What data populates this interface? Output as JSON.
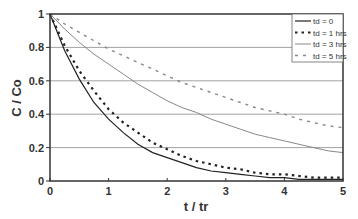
{
  "chart_data": {
    "type": "line",
    "title": "",
    "xlabel": "t / tr",
    "ylabel": "C / Co",
    "xlim": [
      0,
      5
    ],
    "ylim": [
      0,
      1
    ],
    "x_ticks": [
      "0",
      "1",
      "2",
      "3",
      "4",
      "5"
    ],
    "y_ticks": [
      "0",
      "0.2",
      "0.4",
      "0.6",
      "0.8",
      "1"
    ],
    "grid": "horizontal",
    "legend_position": "top-right (inside)",
    "x": [
      0,
      0.25,
      0.5,
      0.75,
      1,
      1.25,
      1.5,
      1.75,
      2,
      2.25,
      2.5,
      2.75,
      3,
      3.25,
      3.5,
      3.75,
      4,
      4.25,
      4.5,
      4.75,
      5
    ],
    "series": [
      {
        "name": "td = 0",
        "style": "solid-black",
        "values": [
          1.0,
          0.78,
          0.61,
          0.47,
          0.37,
          0.29,
          0.22,
          0.17,
          0.14,
          0.11,
          0.08,
          0.06,
          0.05,
          0.04,
          0.03,
          0.02,
          0.02,
          0.01,
          0.01,
          0.01,
          0.01
        ]
      },
      {
        "name": "td = 1 hrs",
        "style": "bold-dotted-black",
        "values": [
          1.0,
          0.81,
          0.66,
          0.54,
          0.43,
          0.35,
          0.29,
          0.23,
          0.19,
          0.15,
          0.12,
          0.1,
          0.08,
          0.07,
          0.05,
          0.04,
          0.04,
          0.03,
          0.02,
          0.02,
          0.02
        ]
      },
      {
        "name": "td = 3 hrs",
        "style": "solid-gray",
        "values": [
          1.0,
          0.91,
          0.83,
          0.76,
          0.7,
          0.64,
          0.58,
          0.53,
          0.48,
          0.44,
          0.41,
          0.37,
          0.34,
          0.31,
          0.28,
          0.26,
          0.24,
          0.22,
          0.2,
          0.18,
          0.17
        ]
      },
      {
        "name": "td = 5 hrs",
        "style": "dashed-gray",
        "values": [
          1.0,
          0.94,
          0.89,
          0.84,
          0.79,
          0.75,
          0.71,
          0.67,
          0.63,
          0.59,
          0.56,
          0.53,
          0.5,
          0.47,
          0.44,
          0.42,
          0.4,
          0.37,
          0.35,
          0.33,
          0.32
        ]
      }
    ]
  },
  "colors": {
    "td0": "#222222",
    "td1": "#222222",
    "td3": "#888888",
    "td5": "#888888",
    "grid": "#8a8a8a",
    "axis": "#333333"
  }
}
